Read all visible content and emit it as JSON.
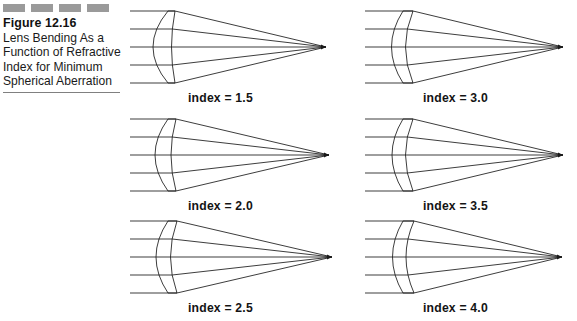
{
  "figure": {
    "number": "Figure 12.16",
    "title": "Lens Bending As a Function of Refractive Index for Minimum Spherical Aberration",
    "decor_dash_count": 4,
    "dash_color": "#9a9a9a",
    "rule_color": "#808080"
  },
  "chart_data": {
    "type": "diagram",
    "title": "Lens Bending As a Function of Refractive Index for Minimum Spherical Aberration",
    "ray_count_per_panel": 5,
    "grid": {
      "rows": 3,
      "cols": 2,
      "order": "column-major"
    },
    "categories": [
      "index = 1.5",
      "index = 2.0",
      "index = 2.5",
      "index = 3.0",
      "index = 3.5",
      "index = 4.0"
    ],
    "values": [
      1.5,
      2.0,
      2.5,
      3.0,
      3.5,
      4.0
    ],
    "xlabel": "",
    "ylabel": "",
    "panels": [
      {
        "id": "panel-index-1-5",
        "label": "index = 1.5",
        "refractive_index": 1.5,
        "shape": "biconvex",
        "front_bulge": 30,
        "back_bulge": 4,
        "center_thickness": 30,
        "edge_thickness": 7,
        "focal_x": 196,
        "column": 0,
        "row": 0
      },
      {
        "id": "panel-index-2-0",
        "label": "index = 2.0",
        "refractive_index": 2.0,
        "shape": "convex-plano",
        "front_bulge": 26,
        "back_bulge": -3,
        "center_thickness": 24,
        "edge_thickness": 8,
        "focal_x": 199,
        "column": 0,
        "row": 1
      },
      {
        "id": "panel-index-2-5",
        "label": "index = 2.5",
        "refractive_index": 2.5,
        "shape": "meniscus-weak",
        "front_bulge": 24,
        "back_bulge": -9,
        "center_thickness": 20,
        "edge_thickness": 9,
        "focal_x": 202,
        "column": 0,
        "row": 2
      },
      {
        "id": "panel-index-3-0",
        "label": "index = 3.0",
        "refractive_index": 3.0,
        "shape": "meniscus",
        "front_bulge": 23,
        "back_bulge": -13,
        "center_thickness": 18,
        "edge_thickness": 10,
        "focal_x": 198,
        "column": 1,
        "row": 0
      },
      {
        "id": "panel-index-3-5",
        "label": "index = 3.5",
        "refractive_index": 3.5,
        "shape": "meniscus-strong",
        "front_bulge": 22,
        "back_bulge": -15,
        "center_thickness": 17,
        "edge_thickness": 10,
        "focal_x": 198,
        "column": 1,
        "row": 1
      },
      {
        "id": "panel-index-4-0",
        "label": "index = 4.0",
        "refractive_index": 4.0,
        "shape": "meniscus-strong",
        "front_bulge": 21,
        "back_bulge": -17,
        "center_thickness": 16,
        "edge_thickness": 11,
        "focal_x": 197,
        "column": 1,
        "row": 2
      }
    ],
    "legend": [],
    "annotations": [
      "Figure 12.16"
    ]
  }
}
